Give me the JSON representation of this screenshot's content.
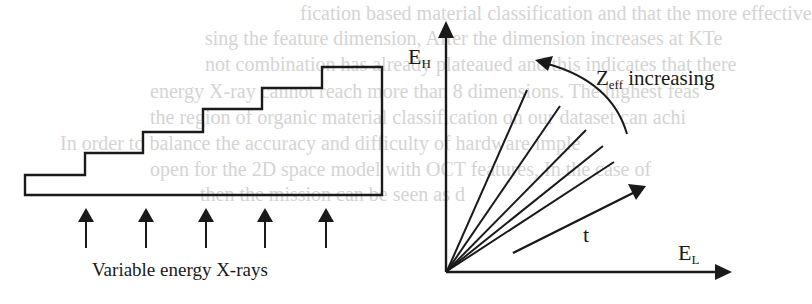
{
  "background_text": {
    "lines": [
      "fication based material classification and that the more effective",
      "sing the feature dimension, After the dimension increases at KTe",
      "not combination has already plateaued and this indicates that there",
      "energy X-ray cannot reach more than 8 dimensions. The highest feas",
      "the region of organic material classification on our dataset can achi",
      "In order to balance the accuracy and difficulty of hardware imple",
      "open for the 2D space model with OCT features, In the case of",
      "then the mission can be seen as d"
    ],
    "color": "#d4d4d4"
  },
  "left_panel": {
    "caption": "Variable energy X-rays",
    "staircase_steps": 6,
    "arrow_count": 5,
    "stroke_color": "#1a1a1a"
  },
  "right_panel": {
    "y_axis_label_main": "E",
    "y_axis_label_sub": "H",
    "x_axis_label_main": "E",
    "x_axis_label_sub": "L",
    "curve_label_main": "Z",
    "curve_label_sub": "eff",
    "curve_label_rest": " increasing",
    "thickness_label": "t",
    "ray_count": 5
  }
}
